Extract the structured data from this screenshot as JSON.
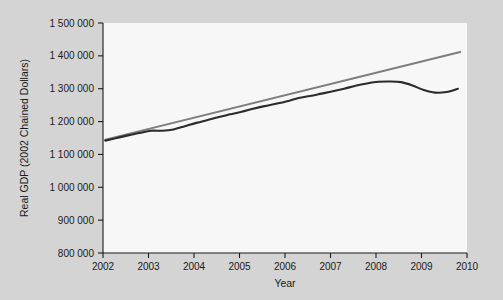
{
  "chart_data": {
    "type": "line",
    "title": "",
    "xlabel": "Year",
    "ylabel": "Real GDP (2002 Chained Dollars)",
    "xlim": [
      2002,
      2010
    ],
    "ylim": [
      800000,
      1500000
    ],
    "grid": false,
    "legend": "none",
    "xticks": [
      2002,
      2003,
      2004,
      2005,
      2006,
      2007,
      2008,
      2009,
      2010
    ],
    "xtick_labels": [
      "2002",
      "2003",
      "2004",
      "2005",
      "2006",
      "2007",
      "2008",
      "2009",
      "2010"
    ],
    "yticks": [
      800000,
      900000,
      1000000,
      1100000,
      1200000,
      1300000,
      1400000,
      1500000
    ],
    "ytick_labels": [
      "800 000",
      "900 000",
      "1 000 000",
      "1 100 000",
      "1 200 000",
      "1 300 000",
      "1 400 000",
      "1 500 000"
    ],
    "series": [
      {
        "name": "Real GDP",
        "color": "#2b2b2b",
        "x": [
          2002.05,
          2002.3,
          2002.55,
          2002.8,
          2003.05,
          2003.3,
          2003.55,
          2003.8,
          2004.05,
          2004.3,
          2004.55,
          2004.8,
          2005.05,
          2005.3,
          2005.55,
          2005.8,
          2006.05,
          2006.3,
          2006.55,
          2006.8,
          2007.05,
          2007.3,
          2007.55,
          2007.8,
          2008.05,
          2008.3,
          2008.55,
          2008.8,
          2009.05,
          2009.3,
          2009.55,
          2009.8
        ],
        "values": [
          1142000,
          1150000,
          1158000,
          1165000,
          1172000,
          1172000,
          1176000,
          1186000,
          1196000,
          1205000,
          1214000,
          1222000,
          1230000,
          1239000,
          1247000,
          1254000,
          1262000,
          1272000,
          1278000,
          1285000,
          1292000,
          1300000,
          1309000,
          1316000,
          1321000,
          1322000,
          1320000,
          1310000,
          1296000,
          1288000,
          1290000,
          1300000
        ]
      },
      {
        "name": "Trend",
        "color": "#7d7d7d",
        "x": [
          2002.05,
          2009.85
        ],
        "values": [
          1145000,
          1412000
        ]
      }
    ]
  }
}
